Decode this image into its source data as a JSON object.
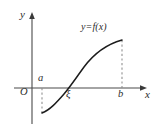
{
  "figure": {
    "background_color": "#ffffff",
    "curve_color": "#1c1c1c",
    "axis_color": "#4a4a4a",
    "dash_color": "#8d8d8d",
    "label_color": "#2b2b2b"
  },
  "labels": {
    "y_axis": "y",
    "x_axis": "x",
    "origin": "O",
    "point_a": "a",
    "point_xi": "ξ",
    "point_b": "b",
    "function": "y=f(x)"
  },
  "icons": {
    "y_axis_arrow": "arrow-up-icon",
    "x_axis_arrow": "arrow-right-icon"
  },
  "chart_data": {
    "type": "line",
    "title": "",
    "xlabel": "x",
    "ylabel": "y",
    "grid": false,
    "legend": "none",
    "annotations": [
      {
        "name": "function-label",
        "text": "y=f(x)",
        "x": 99,
        "y": 29
      },
      {
        "name": "a-label",
        "text": "a",
        "x": 42,
        "y": 80
      },
      {
        "name": "xi-label",
        "text": "ξ",
        "x": 70,
        "y": 96
      },
      {
        "name": "b-label",
        "text": "b",
        "x": 121,
        "y": 96
      },
      {
        "name": "origin-label",
        "text": "O",
        "x": 24,
        "y": 93
      }
    ],
    "axes": {
      "origin_px": [
        32,
        88
      ],
      "x_axis_y_px": 88,
      "y_axis_x_px": 32,
      "x_axis_end_px": 146,
      "y_axis_top_px": 13
    },
    "series": [
      {
        "name": "f(x)",
        "description": "increasing S-shaped (sigmoid) curve from below the axis at x=a to above the axis at x=b",
        "points_px": [
          [
            42,
            113
          ],
          [
            48,
            110
          ],
          [
            54,
            105
          ],
          [
            60,
            98
          ],
          [
            66,
            92
          ],
          [
            70,
            88
          ],
          [
            76,
            79
          ],
          [
            84,
            66
          ],
          [
            93,
            55
          ],
          [
            103,
            47
          ],
          [
            112,
            42
          ],
          [
            122,
            40
          ]
        ],
        "path_d": "M 42 113 C 50 110 57 102 64 94 C 70 87 76 78 84 67 C 93 55 104 45 122 40"
      }
    ],
    "markers": [
      {
        "name": "a",
        "x_px": 42,
        "y_px": 88,
        "value_label": "a",
        "below_axis": true
      },
      {
        "name": "xi",
        "x_px": 70,
        "y_px": 88,
        "value_label": "ξ",
        "is_root": true
      },
      {
        "name": "b",
        "x_px": 122,
        "y_px": 88,
        "value_label": "b",
        "above_axis": true
      }
    ],
    "guides": [
      {
        "name": "dashed-guide-a",
        "x_px": 42,
        "y_from_px": 88,
        "y_to_px": 113,
        "style": "dashed"
      },
      {
        "name": "dashed-guide-b",
        "x_px": 122,
        "y_from_px": 40,
        "y_to_px": 88,
        "style": "dashed"
      }
    ]
  }
}
